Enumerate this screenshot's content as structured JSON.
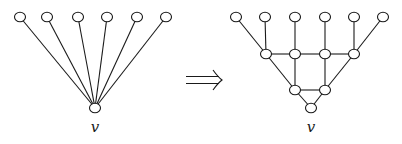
{
  "diagram": {
    "type": "graph-transformation",
    "left_graph": {
      "name": "star",
      "center_label": "v",
      "center": {
        "x": 95,
        "y": 108
      },
      "label_pos": {
        "x": 95,
        "y": 132
      },
      "leaves": [
        {
          "x": 20,
          "y": 17
        },
        {
          "x": 47,
          "y": 17
        },
        {
          "x": 78,
          "y": 17
        },
        {
          "x": 107,
          "y": 17
        },
        {
          "x": 137,
          "y": 17
        },
        {
          "x": 166,
          "y": 17
        }
      ]
    },
    "arrow": {
      "symbol": "⟹",
      "x1": 186,
      "x2": 222,
      "y": 80
    },
    "right_graph": {
      "name": "expanded",
      "center_label": "v",
      "label_pos": {
        "x": 311,
        "y": 132
      },
      "nodes": {
        "t1": {
          "x": 236,
          "y": 17
        },
        "t2": {
          "x": 265,
          "y": 17
        },
        "t3": {
          "x": 295,
          "y": 17
        },
        "t4": {
          "x": 325,
          "y": 17
        },
        "t5": {
          "x": 354,
          "y": 17
        },
        "t6": {
          "x": 383,
          "y": 17
        },
        "m1": {
          "x": 266,
          "y": 54
        },
        "m2": {
          "x": 295,
          "y": 54
        },
        "m3": {
          "x": 325,
          "y": 54
        },
        "m4": {
          "x": 354,
          "y": 54
        },
        "l1": {
          "x": 295,
          "y": 90
        },
        "l2": {
          "x": 325,
          "y": 90
        },
        "v": {
          "x": 311,
          "y": 108
        }
      },
      "edges": [
        [
          "t1",
          "m1"
        ],
        [
          "t2",
          "m1"
        ],
        [
          "t3",
          "m2"
        ],
        [
          "t4",
          "m3"
        ],
        [
          "t5",
          "m4"
        ],
        [
          "t6",
          "m4"
        ],
        [
          "m1",
          "m2"
        ],
        [
          "m2",
          "m3"
        ],
        [
          "m3",
          "m4"
        ],
        [
          "m1",
          "l1"
        ],
        [
          "m2",
          "l1"
        ],
        [
          "m3",
          "l2"
        ],
        [
          "m4",
          "l2"
        ],
        [
          "l1",
          "l2"
        ],
        [
          "l1",
          "v"
        ],
        [
          "l2",
          "v"
        ]
      ]
    },
    "node_radius_x": 5.5,
    "node_radius_y": 4.8
  }
}
